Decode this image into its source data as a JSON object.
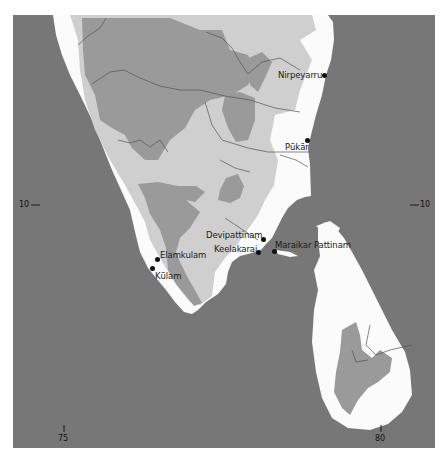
{
  "map": {
    "title": "",
    "colors": {
      "sea": "#777777",
      "lowland": "#fbfbfb",
      "upland": "#cfcfcf",
      "highland": "#9a9a9a",
      "rivers": "#555555",
      "page": "#ffffff"
    },
    "legend_meaning": {
      "lowland": "white land",
      "upland": "light grey land",
      "highland": "dark grey land"
    },
    "places": [
      {
        "name": "Nirpeyarru",
        "label": "Nirpeyarru"
      },
      {
        "name": "Pukar",
        "label": "Pūkār"
      },
      {
        "name": "Devipattinam",
        "label": "Devipattinam"
      },
      {
        "name": "Keelakarai",
        "label": "Keelakarai"
      },
      {
        "name": "Maraikar Pattinam",
        "label": "Maraikar Pattinam"
      },
      {
        "name": "Elamkulam",
        "label": "Elamkulam"
      },
      {
        "name": "Kulam",
        "label": "Kūlam"
      }
    ],
    "graticule": {
      "lat_left": "10",
      "lat_right": "10",
      "lon_left": "75",
      "lon_right": "80"
    }
  }
}
